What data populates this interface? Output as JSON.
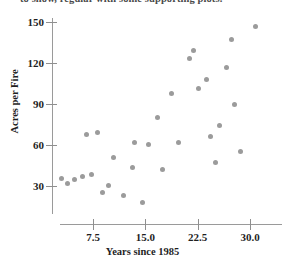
{
  "caption_fragment": "to show, regular with some supporting plots.",
  "chart_data": {
    "type": "scatter",
    "title": "",
    "xlabel": "Years since 1985",
    "ylabel": "Acres per Fire",
    "xlim": [
      2.0,
      33.0
    ],
    "ylim": [
      12.0,
      152.0
    ],
    "xticks": [
      "7.5",
      "15.0",
      "22.5",
      "30.0"
    ],
    "xtick_values": [
      7.5,
      15.0,
      22.5,
      30.0
    ],
    "yticks": [
      "30",
      "60",
      "90",
      "120",
      "150"
    ],
    "ytick_values": [
      30,
      60,
      90,
      120,
      150
    ],
    "grid": false,
    "legend": "none",
    "marker_color": "#9b9b9b",
    "points": [
      {
        "x": 3.0,
        "y": 35.5
      },
      {
        "x": 3.9,
        "y": 31.5
      },
      {
        "x": 4.8,
        "y": 34.5
      },
      {
        "x": 6.0,
        "y": 37.0
      },
      {
        "x": 6.5,
        "y": 68.0
      },
      {
        "x": 7.3,
        "y": 38.5
      },
      {
        "x": 8.1,
        "y": 69.0
      },
      {
        "x": 8.9,
        "y": 25.5
      },
      {
        "x": 9.7,
        "y": 30.5
      },
      {
        "x": 10.4,
        "y": 50.5
      },
      {
        "x": 11.8,
        "y": 23.0
      },
      {
        "x": 13.2,
        "y": 43.5
      },
      {
        "x": 13.5,
        "y": 61.5
      },
      {
        "x": 14.6,
        "y": 18.0
      },
      {
        "x": 15.5,
        "y": 60.5
      },
      {
        "x": 16.8,
        "y": 80.0
      },
      {
        "x": 17.4,
        "y": 42.0
      },
      {
        "x": 18.8,
        "y": 98.0
      },
      {
        "x": 19.8,
        "y": 61.5
      },
      {
        "x": 21.3,
        "y": 123.0
      },
      {
        "x": 21.9,
        "y": 129.5
      },
      {
        "x": 22.6,
        "y": 101.5
      },
      {
        "x": 23.7,
        "y": 108.0
      },
      {
        "x": 24.3,
        "y": 66.5
      },
      {
        "x": 25.0,
        "y": 47.5
      },
      {
        "x": 25.6,
        "y": 74.0
      },
      {
        "x": 26.6,
        "y": 117.0
      },
      {
        "x": 27.3,
        "y": 137.5
      },
      {
        "x": 27.8,
        "y": 90.0
      },
      {
        "x": 28.6,
        "y": 55.5
      },
      {
        "x": 30.8,
        "y": 147.0
      }
    ]
  }
}
